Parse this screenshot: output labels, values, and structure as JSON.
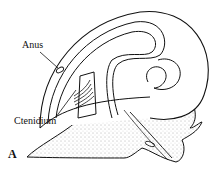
{
  "figure": {
    "panel_label": "A",
    "labels": [
      {
        "id": "anus",
        "text": "Anus"
      },
      {
        "id": "ctenidium",
        "text": "Ctenidium"
      }
    ],
    "colors": {
      "line": "#111111",
      "stipple": "#555555",
      "background": "#ffffff"
    }
  }
}
